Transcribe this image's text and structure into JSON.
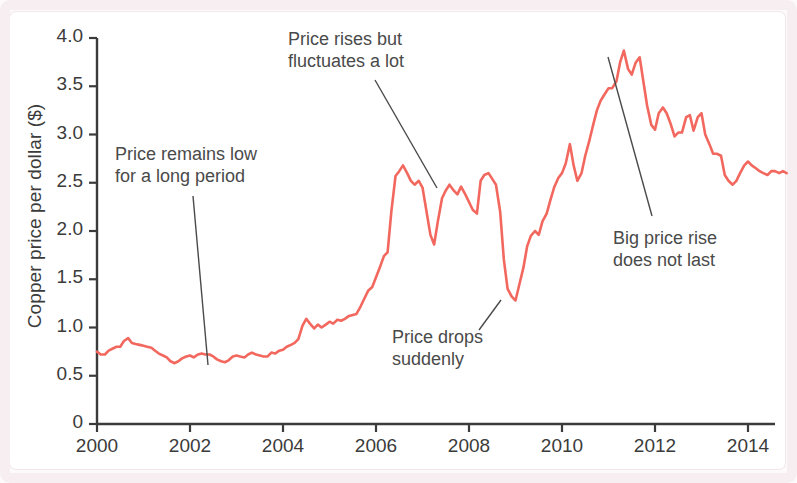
{
  "chart_data": {
    "type": "line",
    "title": "",
    "xlabel": "",
    "ylabel": "Copper price per dollar ($)",
    "xlim": [
      2000,
      2014.9
    ],
    "ylim": [
      0,
      4.0
    ],
    "grid": false,
    "legend": null,
    "line_color": "#f2685e",
    "axis_color": "#3b3b3b",
    "y_ticks": [
      "0",
      "0.5",
      "1.0",
      "1.5",
      "2.0",
      "2.5",
      "3.0",
      "3.5",
      "4.0"
    ],
    "y_tick_values": [
      0,
      0.5,
      1.0,
      1.5,
      2.0,
      2.5,
      3.0,
      3.5,
      4.0
    ],
    "x_ticks": [
      "2000",
      "2002",
      "2004",
      "2006",
      "2008",
      "2010",
      "2012",
      "2014"
    ],
    "x_tick_values": [
      2000,
      2002,
      2004,
      2006,
      2008,
      2010,
      2012,
      2014
    ],
    "series": [
      {
        "name": "Copper price per dollar ($)",
        "x": [
          2000.0,
          2000.08,
          2000.17,
          2000.25,
          2000.33,
          2000.42,
          2000.5,
          2000.58,
          2000.67,
          2000.75,
          2000.83,
          2000.92,
          2001.0,
          2001.08,
          2001.17,
          2001.25,
          2001.33,
          2001.42,
          2001.5,
          2001.58,
          2001.67,
          2001.75,
          2001.83,
          2001.92,
          2002.0,
          2002.08,
          2002.17,
          2002.25,
          2002.33,
          2002.42,
          2002.5,
          2002.58,
          2002.67,
          2002.75,
          2002.83,
          2002.92,
          2003.0,
          2003.08,
          2003.17,
          2003.25,
          2003.33,
          2003.42,
          2003.5,
          2003.58,
          2003.67,
          2003.75,
          2003.83,
          2003.92,
          2004.0,
          2004.08,
          2004.17,
          2004.25,
          2004.33,
          2004.42,
          2004.5,
          2004.58,
          2004.67,
          2004.75,
          2004.83,
          2004.92,
          2005.0,
          2005.08,
          2005.17,
          2005.25,
          2005.33,
          2005.42,
          2005.5,
          2005.58,
          2005.67,
          2005.75,
          2005.83,
          2005.92,
          2006.0,
          2006.08,
          2006.17,
          2006.25,
          2006.33,
          2006.42,
          2006.5,
          2006.58,
          2006.67,
          2006.75,
          2006.83,
          2006.92,
          2007.0,
          2007.08,
          2007.17,
          2007.25,
          2007.33,
          2007.42,
          2007.5,
          2007.58,
          2007.67,
          2007.75,
          2007.83,
          2007.92,
          2008.0,
          2008.08,
          2008.17,
          2008.25,
          2008.33,
          2008.42,
          2008.5,
          2008.58,
          2008.67,
          2008.75,
          2008.83,
          2008.92,
          2009.0,
          2009.08,
          2009.17,
          2009.25,
          2009.33,
          2009.42,
          2009.5,
          2009.58,
          2009.67,
          2009.75,
          2009.83,
          2009.92,
          2010.0,
          2010.08,
          2010.17,
          2010.25,
          2010.33,
          2010.42,
          2010.5,
          2010.58,
          2010.67,
          2010.75,
          2010.83,
          2010.92,
          2011.0,
          2011.08,
          2011.17,
          2011.25,
          2011.33,
          2011.42,
          2011.5,
          2011.58,
          2011.67,
          2011.75,
          2011.83,
          2011.92,
          2012.0,
          2012.08,
          2012.17,
          2012.25,
          2012.33,
          2012.42,
          2012.5,
          2012.58,
          2012.67,
          2012.75,
          2012.83,
          2012.92,
          2013.0,
          2013.08,
          2013.17,
          2013.25,
          2013.33,
          2013.42,
          2013.5,
          2013.58,
          2013.67,
          2013.75,
          2013.83,
          2013.92,
          2014.0,
          2014.08,
          2014.17,
          2014.25,
          2014.33,
          2014.42,
          2014.5,
          2014.58,
          2014.67,
          2014.75,
          2014.83
        ],
        "values": [
          0.75,
          0.72,
          0.72,
          0.76,
          0.78,
          0.8,
          0.8,
          0.86,
          0.89,
          0.84,
          0.83,
          0.82,
          0.81,
          0.8,
          0.79,
          0.76,
          0.73,
          0.71,
          0.69,
          0.65,
          0.63,
          0.65,
          0.68,
          0.7,
          0.71,
          0.69,
          0.72,
          0.73,
          0.72,
          0.72,
          0.7,
          0.67,
          0.65,
          0.64,
          0.66,
          0.7,
          0.71,
          0.7,
          0.69,
          0.72,
          0.74,
          0.72,
          0.71,
          0.7,
          0.7,
          0.74,
          0.73,
          0.76,
          0.77,
          0.8,
          0.82,
          0.84,
          0.88,
          1.02,
          1.09,
          1.04,
          0.99,
          1.03,
          1.0,
          1.03,
          1.06,
          1.04,
          1.08,
          1.07,
          1.09,
          1.12,
          1.13,
          1.14,
          1.22,
          1.3,
          1.38,
          1.42,
          1.52,
          1.62,
          1.74,
          1.78,
          2.2,
          2.57,
          2.62,
          2.68,
          2.6,
          2.52,
          2.48,
          2.52,
          2.45,
          2.22,
          1.96,
          1.86,
          2.1,
          2.34,
          2.42,
          2.48,
          2.42,
          2.38,
          2.46,
          2.38,
          2.3,
          2.22,
          2.18,
          2.52,
          2.58,
          2.6,
          2.54,
          2.48,
          2.2,
          1.7,
          1.4,
          1.32,
          1.28,
          1.44,
          1.62,
          1.84,
          1.95,
          2.0,
          1.96,
          2.1,
          2.18,
          2.32,
          2.45,
          2.55,
          2.6,
          2.7,
          2.9,
          2.68,
          2.52,
          2.6,
          2.78,
          2.92,
          3.1,
          3.25,
          3.35,
          3.42,
          3.48,
          3.48,
          3.55,
          3.75,
          3.87,
          3.68,
          3.62,
          3.74,
          3.8,
          3.55,
          3.3,
          3.1,
          3.05,
          3.22,
          3.28,
          3.22,
          3.12,
          2.98,
          3.02,
          3.02,
          3.18,
          3.2,
          3.04,
          3.18,
          3.22,
          3.0,
          2.9,
          2.8,
          2.8,
          2.78,
          2.58,
          2.52,
          2.48,
          2.52,
          2.6,
          2.68,
          2.72,
          2.68,
          2.65,
          2.62,
          2.6,
          2.58,
          2.62,
          2.62,
          2.6,
          2.62,
          2.6
        ]
      }
    ],
    "annotations": [
      {
        "id": "price-remains-low",
        "text": "Price remains low\nfor a long period",
        "text_x": 115,
        "text_y": 144,
        "leader_from": [
          193,
          196
        ],
        "leader_to": [
          208,
          365
        ]
      },
      {
        "id": "price-rises-fluctuates",
        "text": "Price rises but\nfluctuates a lot",
        "text_x": 288,
        "text_y": 29,
        "leader_from": [
          375,
          80
        ],
        "leader_to": [
          437,
          188
        ]
      },
      {
        "id": "price-drops-suddenly",
        "text": "Price drops\nsuddenly",
        "text_x": 392,
        "text_y": 327,
        "leader_from": [
          501,
          300
        ],
        "leader_to": [
          479,
          330
        ]
      },
      {
        "id": "big-price-rise",
        "text": "Big price rise\ndoes not last",
        "text_x": 613,
        "text_y": 228,
        "leader_from": [
          608,
          57
        ],
        "leader_to": [
          652,
          216
        ]
      }
    ]
  }
}
